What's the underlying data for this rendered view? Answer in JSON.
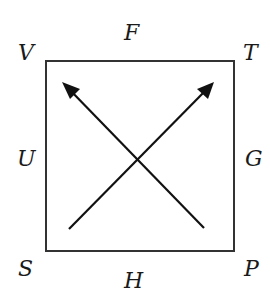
{
  "diagram": {
    "labels": {
      "top_left": "V",
      "top": "F",
      "top_right": "T",
      "left": "U",
      "right": "G",
      "bottom_left": "S",
      "bottom": "H",
      "bottom_right": "P"
    },
    "square": {
      "x": 46,
      "y": 61,
      "width": 188,
      "height": 190,
      "stroke": "#333333"
    },
    "arrows": [
      {
        "from": "bottom-left",
        "to": "top-left",
        "x1": 69,
        "y1": 229,
        "x2": 62,
        "y2": 82
      },
      {
        "from": "bottom-right",
        "to": "top-right",
        "x1": 204,
        "y1": 228,
        "x2": 214,
        "y2": 82
      }
    ],
    "stroke_color": "#1a1a1a"
  }
}
